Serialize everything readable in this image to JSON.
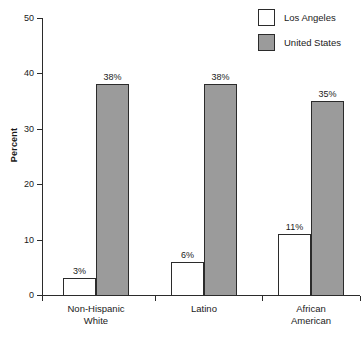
{
  "chart_data": {
    "type": "bar",
    "title": "",
    "xlabel": "",
    "ylabel": "Percent",
    "ylim": [
      0,
      50
    ],
    "yticks": [
      0,
      10,
      20,
      30,
      40,
      50
    ],
    "ytick_labels": [
      "0",
      "10",
      "20",
      "30",
      "40",
      "50"
    ],
    "grid": false,
    "legend_position": "top-right",
    "categories": [
      "Non-Hispanic White",
      "Latino",
      "African American"
    ],
    "category_lines": [
      [
        "Non-Hispanic",
        "White"
      ],
      [
        "Latino",
        ""
      ],
      [
        "African",
        "American"
      ]
    ],
    "series": [
      {
        "name": "Los Angeles",
        "color": "#ffffff",
        "edge_color": "#2b2b2b",
        "values": [
          3,
          6,
          11
        ],
        "labels": [
          "3%",
          "6%",
          "11%"
        ]
      },
      {
        "name": "United States",
        "color": "#9b9b9b",
        "edge_color": "#2b2b2b",
        "values": [
          38,
          38,
          35
        ],
        "labels": [
          "38%",
          "38%",
          "35%"
        ]
      }
    ]
  },
  "legend": {
    "items": [
      {
        "label": "Los Angeles",
        "swatch": "white"
      },
      {
        "label": "United States",
        "swatch": "gray"
      }
    ]
  },
  "axis": {
    "y_title": "Percent"
  }
}
